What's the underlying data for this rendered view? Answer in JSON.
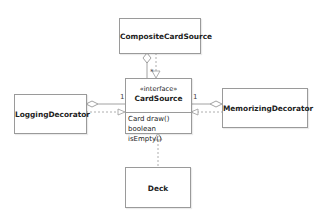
{
  "diagram": {
    "type": "UML class diagram",
    "classes": [
      {
        "id": "composite",
        "name": "CompositeCardSource"
      },
      {
        "id": "cardsource",
        "name": "CardSource",
        "stereotype": "«interface»",
        "methods": [
          "Card draw()",
          "boolean isEmpty()"
        ]
      },
      {
        "id": "logging",
        "name": "LoggingDecorator"
      },
      {
        "id": "memorizing",
        "name": "MemorizingDecorator"
      },
      {
        "id": "deck",
        "name": "Deck"
      }
    ],
    "relations": [
      {
        "from": "CompositeCardSource",
        "to": "CardSource",
        "kind": "aggregation",
        "multiplicity": "*"
      },
      {
        "from": "CompositeCardSource",
        "to": "CardSource",
        "kind": "realization"
      },
      {
        "from": "LoggingDecorator",
        "to": "CardSource",
        "kind": "aggregation",
        "multiplicity": "1"
      },
      {
        "from": "LoggingDecorator",
        "to": "CardSource",
        "kind": "realization"
      },
      {
        "from": "MemorizingDecorator",
        "to": "CardSource",
        "kind": "aggregation",
        "multiplicity": "1"
      },
      {
        "from": "MemorizingDecorator",
        "to": "CardSource",
        "kind": "realization"
      },
      {
        "from": "Deck",
        "to": "CardSource",
        "kind": "realization"
      }
    ],
    "colors": {
      "border": "#9a9a9a",
      "line": "#8a8a8a",
      "text": "#222222"
    }
  },
  "labels": {
    "composite": "CompositeCardSource",
    "stereotype": "«interface»",
    "cardsource": "CardSource",
    "method1": "Card draw()",
    "method2": "boolean isEmpty()",
    "logging": "LoggingDecorator",
    "memorizing": "MemorizingDecorator",
    "deck": "Deck",
    "mult_composite": "*",
    "mult_logging": "1",
    "mult_memorizing": "1"
  }
}
